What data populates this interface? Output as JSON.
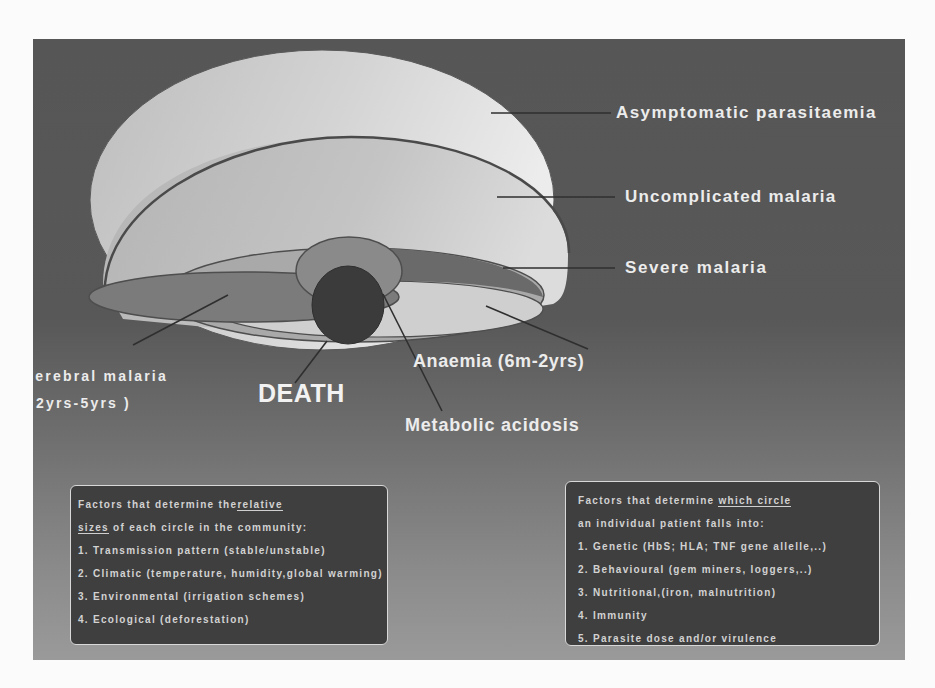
{
  "slide": {
    "colors": {
      "background_top": "#565656",
      "background_bottom": "#9a9a9a",
      "outer_ellipse": "#d8d8d8",
      "death_circle": "#3a3a3a",
      "box_fill": "#3f3f3f",
      "text": "#ececec"
    },
    "labels": {
      "asymptomatic": "Asymptomatic parasitaemia",
      "uncomplicated": "Uncomplicated malaria",
      "severe": "Severe malaria",
      "anaemia": "Anaemia (6m-2yrs)",
      "metabolic": "Metabolic acidosis",
      "cerebral_line1": "Cerebral malaria",
      "cerebral_line2": "( 2yrs-5yrs )",
      "death": "DEATH"
    },
    "left_box": {
      "heading_line1_pre": "Factors that determine the",
      "heading_line1_u": "relative",
      "heading_line2_u": "sizes",
      "heading_line2_post": " of each circle in the community:",
      "items": [
        "1. Transmission pattern (stable/unstable)",
        "2. Climatic (temperature, humidity,global warming)",
        "3. Environmental (irrigation schemes)",
        "4. Ecological (deforestation)"
      ]
    },
    "right_box": {
      "heading_line1_pre": "Factors that determine ",
      "heading_line1_u": "which circle",
      "heading_line2": "an individual patient falls into:",
      "items": [
        "1. Genetic (HbS; HLA; TNF gene allelle,..)",
        "2. Behavioural (gem miners, loggers,..)",
        "3. Nutritional,(iron, malnutrition)",
        "4. Immunity",
        "5. Parasite dose and/or virulence"
      ]
    }
  }
}
